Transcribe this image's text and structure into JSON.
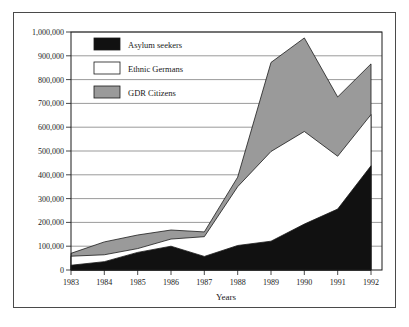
{
  "chart_data": {
    "type": "area",
    "title": "",
    "subtitle": "",
    "xlabel": "Years",
    "ylabel": "",
    "stacked": true,
    "grid": true,
    "legend_position": "top-left",
    "categories": [
      "1983",
      "1984",
      "1985",
      "1986",
      "1987",
      "1988",
      "1989",
      "1990",
      "1991",
      "1992"
    ],
    "x": [
      1983,
      1984,
      1985,
      1986,
      1987,
      1988,
      1989,
      1990,
      1991,
      1992
    ],
    "xlim": [
      1983,
      1992
    ],
    "ylim": [
      0,
      1000000
    ],
    "ytick_labels": [
      "0",
      "100,000",
      "200,000",
      "300,000",
      "400,000",
      "500,000",
      "600,000",
      "700,000",
      "800,000",
      "900,000",
      "1,000,000"
    ],
    "ytick_values": [
      0,
      100000,
      200000,
      300000,
      400000,
      500000,
      600000,
      700000,
      800000,
      900000,
      1000000
    ],
    "xtick_labels": [
      "1983",
      "1984",
      "1985",
      "1986",
      "1987",
      "1988",
      "1989",
      "1990",
      "1991",
      "1992"
    ],
    "series": [
      {
        "name": "Asylum seekers",
        "color": "#111111",
        "values": [
          20000,
          35000,
          74000,
          100000,
          57000,
          103000,
          121000,
          193000,
          256000,
          438000
        ]
      },
      {
        "name": "Ethnic Germans",
        "color": "#ffffff",
        "values": [
          38000,
          29000,
          16000,
          30000,
          83000,
          247000,
          377000,
          389000,
          222000,
          215000
        ]
      },
      {
        "name": "GDR Citizens",
        "color": "#9a9a9a",
        "values": [
          12000,
          54000,
          57000,
          38000,
          20000,
          40000,
          374000,
          393000,
          249000,
          213000
        ]
      }
    ],
    "cumulative_tops": {
      "asylum_seekers": [
        20000,
        35000,
        74000,
        100000,
        57000,
        103000,
        121000,
        193000,
        256000,
        438000
      ],
      "ethnic_germans": [
        58000,
        64000,
        90000,
        130000,
        140000,
        350000,
        498000,
        582000,
        478000,
        653000
      ],
      "gdr_citizens": [
        70000,
        118000,
        147000,
        168000,
        160000,
        390000,
        872000,
        975000,
        727000,
        866000
      ]
    }
  },
  "legend": {
    "items": [
      {
        "label": "Asylum seekers",
        "color": "#111111"
      },
      {
        "label": "Ethnic Germans",
        "color": "#ffffff"
      },
      {
        "label": "GDR Citizens",
        "color": "#9a9a9a"
      }
    ]
  },
  "axes": {
    "x_title": "Years",
    "y_title": ""
  }
}
